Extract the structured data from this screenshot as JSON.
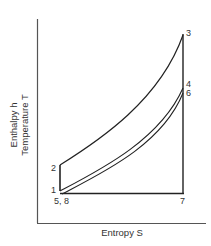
{
  "diagram": {
    "type": "thermodynamic T-S / h-S cycle diagram",
    "axes": {
      "x_label": "Entropy S",
      "y_label_line1": "Enthalpy  h",
      "y_label_line2": "Temperature  T"
    },
    "points": {
      "p1": "1",
      "p2": "2",
      "p3": "3",
      "p4": "4",
      "p6": "6",
      "p7": "7",
      "p58": "5, 8"
    },
    "colors": {
      "line": "#222222",
      "axis": "#555555",
      "text": "#333333"
    }
  }
}
